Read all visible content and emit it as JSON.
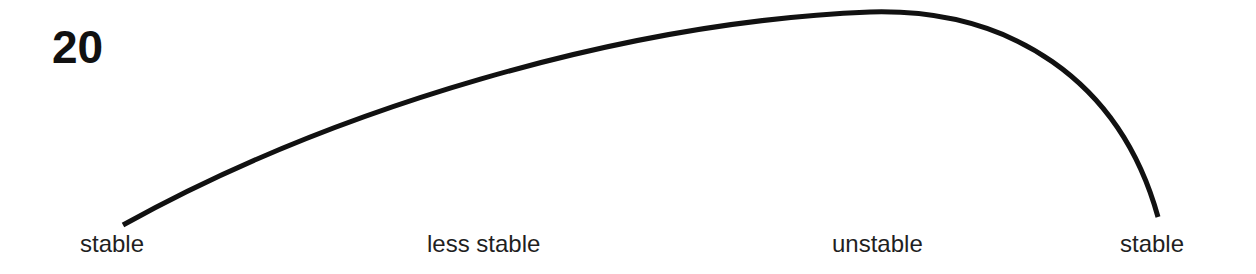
{
  "figure": {
    "number": "20",
    "curve_color": "#111111",
    "background": "#ffffff"
  },
  "labels": [
    {
      "text": "stable"
    },
    {
      "text": "less stable"
    },
    {
      "text": "unstable"
    },
    {
      "text": "stable"
    }
  ],
  "curve": {
    "description": "Arc rising gradually from left endpoint to a peak near the 'unstable' label, then dropping steeply to the right endpoint",
    "start": [
      123,
      225
    ],
    "peak": [
      870,
      12
    ],
    "end": [
      1158,
      217
    ]
  }
}
